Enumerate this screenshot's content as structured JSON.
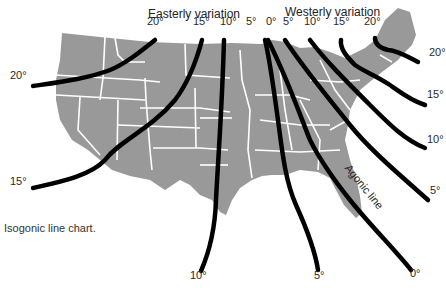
{
  "figure": {
    "caption": "Isogonic line chart.",
    "headings": {
      "easterly": "Easterly variation",
      "westerly": "Westerly variation"
    },
    "agonic_label": "Agonic line",
    "colors": {
      "land": "#999999",
      "state_borders": "#ffffff",
      "isogonic_lines": "#000000",
      "background": "#ffffff"
    }
  },
  "labels": {
    "top": [
      {
        "text": "20°",
        "x": 147,
        "y": 26
      },
      {
        "text": "15°",
        "x": 193,
        "y": 26
      },
      {
        "text": "10°",
        "x": 220,
        "y": 26
      },
      {
        "text": "5°",
        "x": 246,
        "y": 26
      },
      {
        "text": "0°",
        "x": 266,
        "y": 26
      },
      {
        "text": "5°",
        "x": 283,
        "y": 26
      },
      {
        "text": "10°",
        "x": 304,
        "y": 26
      },
      {
        "text": "15°",
        "x": 333,
        "y": 26
      },
      {
        "text": "20°",
        "x": 364,
        "y": 26
      }
    ],
    "left": [
      {
        "text": "20°",
        "x": 10,
        "y": 80
      },
      {
        "text": "15°",
        "x": 10,
        "y": 186
      }
    ],
    "right": [
      {
        "text": "20°",
        "x": 429,
        "y": 57
      },
      {
        "text": "15°",
        "x": 427,
        "y": 99
      },
      {
        "text": "10°",
        "x": 427,
        "y": 144
      },
      {
        "text": "5°",
        "x": 430,
        "y": 195
      }
    ],
    "bottom": [
      {
        "text": "10°",
        "x": 190,
        "y": 280
      },
      {
        "text": "5°",
        "x": 314,
        "y": 280
      },
      {
        "text": "0°",
        "x": 410,
        "y": 278
      }
    ]
  },
  "isogonic_lines": [
    {
      "value": "20° E",
      "path": "M33,86 C60,82 90,78 110,70 C125,64 140,52 155,40"
    },
    {
      "value": "15° E",
      "path": "M33,188 C60,182 90,176 105,160 C120,140 150,130 175,100 C190,80 198,55 202,40"
    },
    {
      "value": "10° E",
      "path": "M201,271 C208,255 215,230 216,200 C218,160 222,110 224,40"
    },
    {
      "value": "5° E",
      "path": "M318,270 C315,250 305,225 296,205 C285,180 282,150 278,120 C273,85 270,60 265,40"
    },
    {
      "value": "0° (Agonic)",
      "path": "M411,270 C395,250 370,225 350,200 C330,175 320,160 310,140 C300,115 288,80 268,40"
    },
    {
      "value": "5° W",
      "path": "M428,200 C400,175 370,150 350,125 C330,100 305,70 285,40"
    },
    {
      "value": "10° W",
      "path": "M425,148 C405,140 390,125 370,105 C345,80 325,60 310,40"
    },
    {
      "value": "15° W",
      "path": "M425,105 C410,100 400,92 390,85 C375,75 365,72 355,65 C345,55 340,48 341,40"
    },
    {
      "value": "20° W",
      "path": "M418,62 C405,55 395,50 388,50 C380,48 375,45 375,38"
    }
  ]
}
